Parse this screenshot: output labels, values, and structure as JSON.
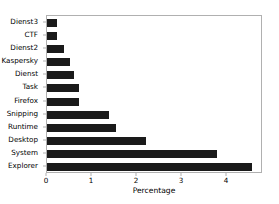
{
  "chart_data": {
    "type": "bar",
    "orientation": "horizontal",
    "title": "",
    "xlabel": "Percentage",
    "ylabel": "",
    "categories": [
      "Dienst3",
      "CTF",
      "Dienst2",
      "Kaspersky",
      "Dienst",
      "Task",
      "Firefox",
      "Snipping",
      "Runtime",
      "Desktop",
      "System",
      "Explorer"
    ],
    "values": [
      0.23,
      0.23,
      0.38,
      0.51,
      0.6,
      0.71,
      0.71,
      1.37,
      1.54,
      2.2,
      3.78,
      4.56
    ],
    "xlim": [
      0,
      4.8
    ],
    "xticks": [
      0,
      1,
      2,
      3,
      4
    ],
    "xticklabels": [
      "0",
      "1",
      "2",
      "3",
      "4"
    ],
    "grid": false,
    "legend": null,
    "bar_color": "#1a1a1a",
    "axes_color": "#b0b0b0"
  }
}
